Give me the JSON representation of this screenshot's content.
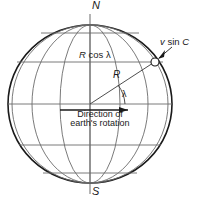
{
  "figure": {
    "labels": {
      "north_pole": "N",
      "south_pole": "S",
      "latitude_radius": "R cos λ",
      "latitude_radius_symbol": "R",
      "latitude_radius_rest": " cos λ",
      "radius": "R",
      "latitude_angle": "λ",
      "velocity_component": "v sin C",
      "velocity_symbol": "v",
      "velocity_mid": " sin ",
      "velocity_course": "C",
      "rotation_line1": "Direction of",
      "rotation_line2": "earth's rotation"
    },
    "colors": {
      "outline": "#1a1a1a",
      "grid": "#6b6b6b",
      "text": "#1a1a1a",
      "background": "#ffffff"
    },
    "geometry": {
      "sphere_center_x": 90,
      "sphere_center_y": 104,
      "sphere_radius_x": 82,
      "sphere_radius_y": 79,
      "north_pole_y": 25,
      "south_pole_y": 183,
      "latitude_lines_y": [
        33,
        62,
        104,
        145,
        173
      ],
      "marker_x": 155,
      "marker_y": 62,
      "marker_radius": 4
    }
  }
}
